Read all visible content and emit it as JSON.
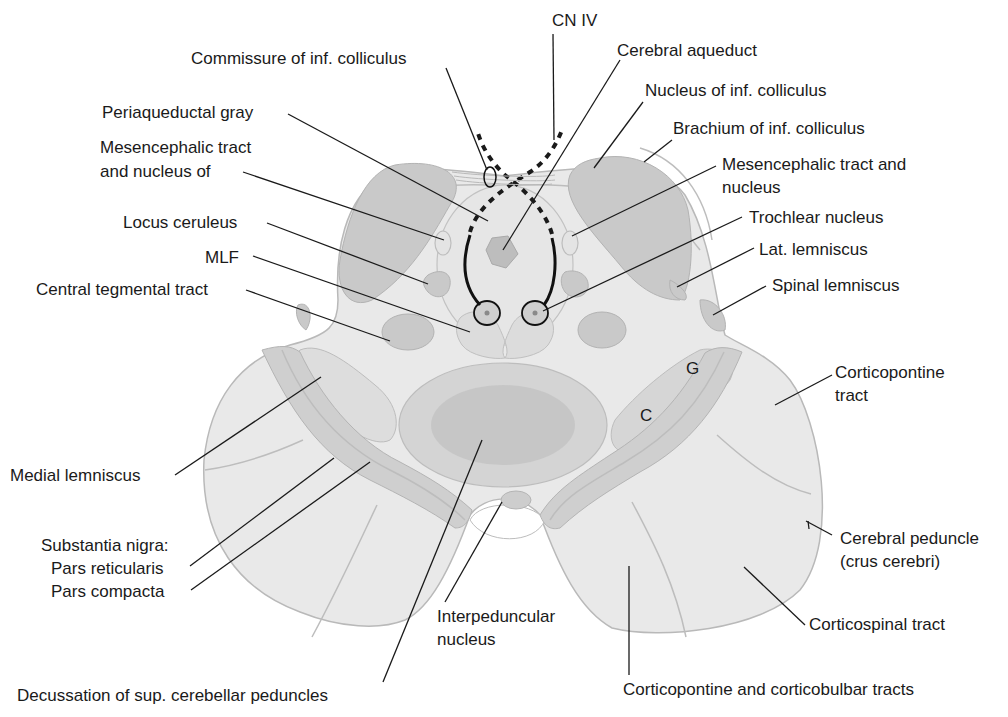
{
  "figure": {
    "colors": {
      "background": "#ffffff",
      "tissue_light": "#e9e9e9",
      "tissue_mid": "#c9c9c9",
      "tissue_dark": "#bdbdbd",
      "outline": "#b9b9b9",
      "label_text": "#1a1a1a"
    }
  },
  "labels": {
    "cn_iv": "CN IV",
    "commissure_inf_colliculus": "Commissure of inf. colliculus",
    "cerebral_aqueduct": "Cerebral aqueduct",
    "nucleus_inf_colliculus": "Nucleus of inf. colliculus",
    "periaqueductal_gray": "Periaqueductal gray",
    "brachium_inf_colliculus": "Brachium of inf. colliculus",
    "mesencephalic_left_line1": "Mesencephalic tract",
    "mesencephalic_left_line2": "and nucleus of",
    "mesencephalic_right_line1": "Mesencephalic tract and",
    "mesencephalic_right_line2": "nucleus",
    "locus_ceruleus": "Locus ceruleus",
    "trochlear_nucleus": "Trochlear nucleus",
    "mlf": "MLF",
    "lat_lemniscus": "Lat. lemniscus",
    "central_tegmental_tract": "Central tegmental tract",
    "spinal_lemniscus": "Spinal lemniscus",
    "g_marker": "G",
    "c_marker": "C",
    "corticopontine_line1": "Corticopontine",
    "corticopontine_line2": "tract",
    "medial_lemniscus": "Medial lemniscus",
    "cerebral_peduncle_line1": "Cerebral peduncle",
    "cerebral_peduncle_line2": "(crus cerebri)",
    "substantia_nigra": "Substantia nigra:",
    "pars_reticularis": "Pars reticularis",
    "pars_compacta": "Pars compacta",
    "interpeduncular_line1": "Interpeduncular",
    "interpeduncular_line2": "nucleus",
    "corticospinal_tract": "Corticospinal tract",
    "decussation_sup_cerebellar": "Decussation of sup. cerebellar peduncles",
    "corticopontine_corticobulbar": "Corticopontine and corticobulbar tracts"
  }
}
